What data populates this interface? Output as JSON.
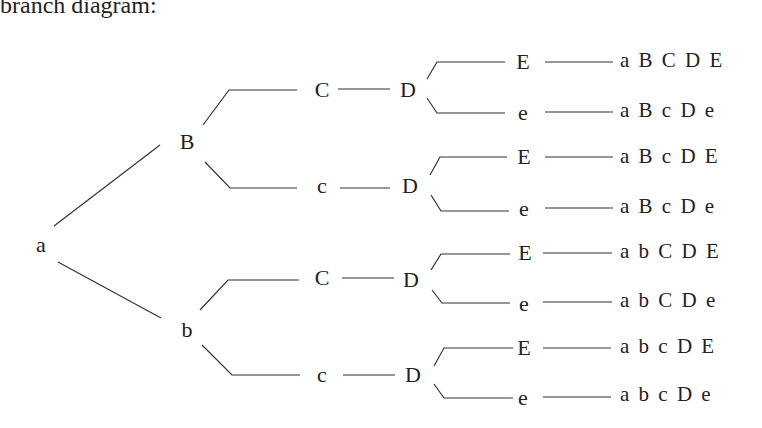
{
  "title": "branch diagram:",
  "root": "a",
  "level1": [
    {
      "label": "B",
      "x": 187,
      "y": 142
    },
    {
      "label": "b",
      "x": 187,
      "y": 330
    }
  ],
  "level2": [
    {
      "label": "C",
      "x": 322,
      "y": 90
    },
    {
      "label": "c",
      "x": 322,
      "y": 186
    },
    {
      "label": "C",
      "x": 322,
      "y": 278
    },
    {
      "label": "c",
      "x": 322,
      "y": 375
    }
  ],
  "level3": [
    {
      "label": "D",
      "x": 408,
      "y": 90
    },
    {
      "label": "D",
      "x": 408,
      "y": 186
    },
    {
      "label": "D",
      "x": 408,
      "y": 280
    },
    {
      "label": "D",
      "x": 412,
      "y": 375
    }
  ],
  "level4": [
    {
      "label": "E",
      "x": 523,
      "y": 62
    },
    {
      "label": "e",
      "x": 522,
      "y": 113
    },
    {
      "label": "E",
      "x": 523,
      "y": 157
    },
    {
      "label": "e",
      "x": 523,
      "y": 208
    },
    {
      "label": "E",
      "x": 524,
      "y": 252
    },
    {
      "label": "e",
      "x": 523,
      "y": 302
    },
    {
      "label": "E",
      "x": 524,
      "y": 347
    },
    {
      "label": "e",
      "x": 522,
      "y": 396
    }
  ],
  "outcomes": [
    {
      "text": "a B C D E",
      "y": 62
    },
    {
      "text": "a B c D e",
      "y": 110
    },
    {
      "text": "a B c D E",
      "y": 157
    },
    {
      "text": "a B c D e",
      "y": 206
    },
    {
      "text": "a b C D E",
      "y": 252
    },
    {
      "text": "a b C D e",
      "y": 300
    },
    {
      "text": "a b c D E",
      "y": 347
    },
    {
      "text": "a b c D e",
      "y": 394
    }
  ]
}
